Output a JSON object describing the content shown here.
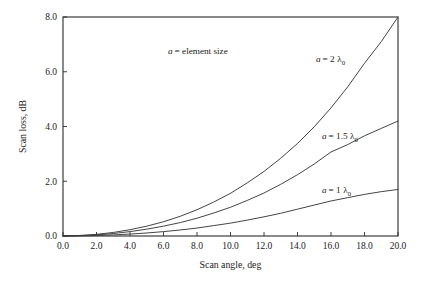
{
  "chart_data": {
    "type": "line",
    "title": "",
    "xlabel": "Scan angle, deg",
    "ylabel": "Scan loss, dB",
    "xlim": [
      0.0,
      20.0
    ],
    "ylim": [
      0.0,
      8.0
    ],
    "xticks": [
      "0.0",
      "2.0",
      "4.0",
      "6.0",
      "8.0",
      "10.0",
      "12.0",
      "14.0",
      "16.0",
      "18.0",
      "20.0"
    ],
    "yticks": [
      "0.0",
      "2.0",
      "4.0",
      "6.0",
      "8.0"
    ],
    "xtick_values": [
      0,
      2,
      4,
      6,
      8,
      10,
      12,
      14,
      16,
      18,
      20
    ],
    "ytick_values": [
      0,
      2,
      4,
      6,
      8
    ],
    "grid": false,
    "legend_position": "inline-curve-labels",
    "annotation": "a = element size",
    "annotation_symbol": "a",
    "annotation_text": "= element size",
    "x": [
      0,
      1,
      2,
      3,
      4,
      5,
      6,
      7,
      8,
      9,
      10,
      11,
      12,
      13,
      14,
      15,
      16,
      17,
      18,
      19,
      20
    ],
    "series": [
      {
        "name": "a = 2 λ0",
        "label_symbol": "a",
        "label_eq": "= 2",
        "label_lambda": "λ",
        "label_sub": "0",
        "color": "#3a3a3a",
        "values": [
          0.0,
          0.02,
          0.06,
          0.13,
          0.23,
          0.36,
          0.52,
          0.72,
          0.96,
          1.24,
          1.56,
          1.94,
          2.36,
          2.84,
          3.38,
          3.99,
          4.68,
          5.45,
          6.31,
          7.1,
          8.0
        ]
      },
      {
        "name": "a = 1.5 λ0",
        "label_symbol": "a",
        "label_eq": "= 1.5",
        "label_lambda": "λ",
        "label_sub": "0",
        "color": "#3a3a3a",
        "values": [
          0.0,
          0.01,
          0.04,
          0.09,
          0.16,
          0.25,
          0.36,
          0.49,
          0.65,
          0.84,
          1.05,
          1.3,
          1.57,
          1.89,
          2.24,
          2.63,
          3.07,
          3.34,
          3.66,
          3.93,
          4.2
        ]
      },
      {
        "name": "a = 1 λ0",
        "label_symbol": "a",
        "label_eq": "= 1",
        "label_lambda": "λ",
        "label_sub": "0",
        "color": "#3a3a3a",
        "values": [
          0.0,
          0.005,
          0.02,
          0.04,
          0.07,
          0.11,
          0.16,
          0.22,
          0.29,
          0.38,
          0.47,
          0.58,
          0.7,
          0.83,
          0.98,
          1.13,
          1.28,
          1.4,
          1.52,
          1.62,
          1.7
        ]
      }
    ]
  },
  "style": {
    "background": "#ffffff",
    "axis_color": "#2b2b2b",
    "curve_color": "#3a3a3a",
    "text_color": "#1a1a1a"
  }
}
